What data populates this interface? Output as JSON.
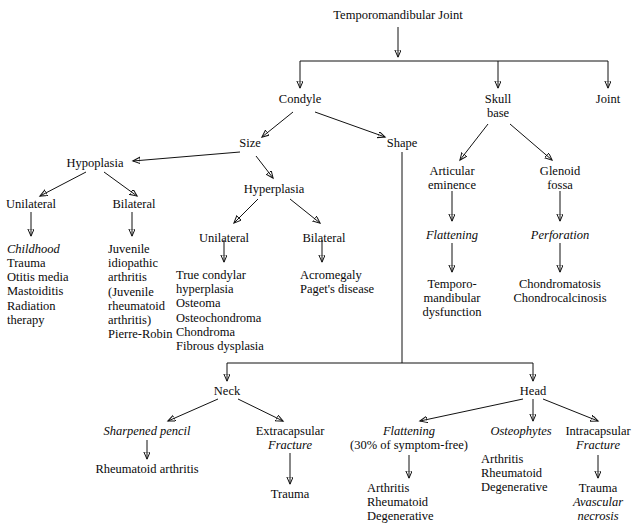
{
  "diagram": {
    "title": "Temporomandibular Joint",
    "type": "flowchart-tree",
    "nodes": {
      "root": "Temporomandibular Joint",
      "condyle": "Condyle",
      "skull_base": "Skull\nbase",
      "joint": "Joint",
      "size": "Size",
      "shape": "Shape",
      "hypoplasia": "Hypoplasia",
      "hyperplasia": "Hyperplasia",
      "hypo_unilateral": "Unilateral",
      "hypo_bilateral": "Bilateral",
      "hypo_unilateral_list": "Childhood",
      "hypo_unilateral_list_rest": "Trauma\nOtitis media\nMastoiditis\nRadiation\ntherapy",
      "hypo_bilateral_list": "Juvenile\nidiopathic\narthritis\n(Juvenile\nrheumatoid\narthritis)\nPierre-Robin",
      "hyper_unilateral": "Unilateral",
      "hyper_bilateral": "Bilateral",
      "hyper_unilateral_list": "True condylar\nhyperplasia\nOsteoma\nOsteochondroma\nChondroma\nFibrous dysplasia",
      "hyper_bilateral_list": "Acromegaly\nPaget's disease",
      "articular_eminence": "Articular\neminence",
      "glenoid_fossa": "Glenoid\nfossa",
      "flattening_ae": "Flattening",
      "perforation": "Perforation",
      "tmj_dysfunction": "Temporo-\nmandibular\ndysfunction",
      "chondromatosis": "Chondromatosis\nChondrocalcinosis",
      "neck": "Neck",
      "head": "Head",
      "sharpened_pencil": "Sharpened pencil",
      "rheumatoid_arthritis": "Rheumatoid arthritis",
      "extracapsular": "Extracapsular",
      "extracapsular_fracture": "Fracture",
      "extracapsular_trauma": "Trauma",
      "head_flattening": "Flattening",
      "head_flattening_note": "(30% of symptom-free)",
      "head_flattening_list": "Arthritis\nRheumatoid\nDegenerative",
      "osteophytes": "Osteophytes",
      "osteophytes_list": "Arthritis\nRheumatoid\nDegenerative",
      "intracapsular": "Intracapsular",
      "intracapsular_fracture": "Fracture",
      "intracapsular_trauma": "Trauma",
      "avascular_necrosis": "Avascular\nnecrosis"
    },
    "colors": {
      "ink": "#111111",
      "background": "#ffffff"
    }
  }
}
